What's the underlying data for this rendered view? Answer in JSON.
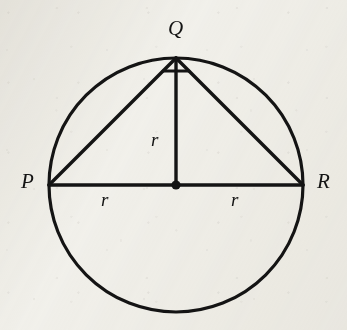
{
  "figure": {
    "type": "geometry-diagram",
    "background_color": "#f2f1ec",
    "ink_color": "#141414",
    "circle": {
      "center_x": 176,
      "center_y": 185,
      "radius": 127,
      "stroke_width": 3.2
    },
    "center_dot": {
      "name": "centre-point",
      "x": 176,
      "y": 185,
      "radius": 4.6
    },
    "points": [
      {
        "id": "P",
        "label": "P",
        "x": 49,
        "y": 185
      },
      {
        "id": "Q",
        "label": "Q",
        "x": 176,
        "y": 58
      },
      {
        "id": "R",
        "label": "R",
        "x": 303,
        "y": 185
      },
      {
        "id": "O",
        "label": "",
        "x": 176,
        "y": 185
      }
    ],
    "segments": [
      {
        "name": "segment-PR-diameter",
        "x1": 49,
        "y1": 185,
        "x2": 303,
        "y2": 185,
        "stroke_width": 3.4
      },
      {
        "name": "segment-PQ",
        "x1": 49,
        "y1": 185,
        "x2": 176,
        "y2": 58,
        "stroke_width": 3.4
      },
      {
        "name": "segment-QR",
        "x1": 176,
        "y1": 58,
        "x2": 303,
        "y2": 185,
        "stroke_width": 3.4
      },
      {
        "name": "segment-QO-radius",
        "x1": 176,
        "y1": 58,
        "x2": 176,
        "y2": 185,
        "stroke_width": 3.4
      }
    ],
    "right_angle_marker": {
      "name": "right-angle-marker-at-Q",
      "at_point": "Q",
      "x1": 163,
      "y1": 71,
      "x2": 189,
      "y2": 71,
      "stroke_width": 3.0
    },
    "vertex_labels": [
      {
        "name": "point-label-P",
        "text": "P",
        "x": 21,
        "y": 171
      },
      {
        "name": "point-label-Q",
        "text": "Q",
        "x": 168,
        "y": 18
      },
      {
        "name": "point-label-R",
        "text": "R",
        "x": 317,
        "y": 171
      }
    ],
    "length_labels": [
      {
        "name": "length-label-r-vertical",
        "text": "r",
        "x": 151,
        "y": 130,
        "measures": "segment-QO-radius"
      },
      {
        "name": "length-label-r-left",
        "text": "r",
        "x": 101,
        "y": 190,
        "measures": "segment-PO-radius"
      },
      {
        "name": "length-label-r-right",
        "text": "r",
        "x": 231,
        "y": 190,
        "measures": "segment-OR-radius"
      }
    ]
  }
}
